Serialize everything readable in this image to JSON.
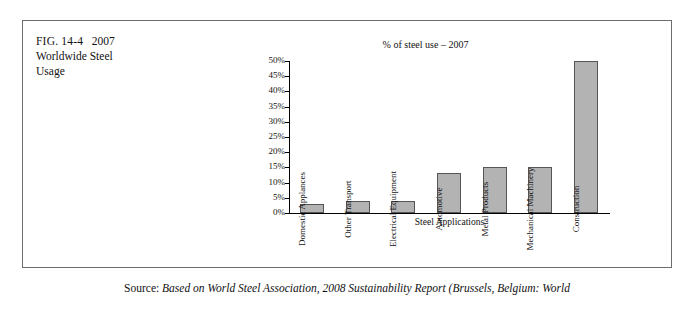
{
  "figure": {
    "label": "FIG. 14-4",
    "year": "2007",
    "title_line1": "Worldwide Steel",
    "title_line2": "Usage"
  },
  "source": {
    "prefix": "Source:",
    "text": "Based on World Steel Association, 2008 Sustainability Report (Brussels, Belgium: World"
  },
  "chart_data": {
    "type": "bar",
    "title": "% of steel use – 2007",
    "xlabel": "Steel Applications",
    "ylabel": "",
    "categories": [
      "Domestic Applances",
      "Other Transport",
      "Electrical Equipment",
      "Automotive",
      "Metal Products",
      "Mechanical Machinery",
      "Construction"
    ],
    "values": [
      3,
      4,
      4,
      13,
      15,
      15,
      50
    ],
    "ylim": [
      0,
      50
    ],
    "ytick_labels": [
      "50%",
      "45%",
      "40%",
      "35%",
      "30%",
      "25%",
      "20%",
      "15%",
      "10%",
      "5%",
      "0%"
    ],
    "ytick_values": [
      50,
      45,
      40,
      35,
      30,
      25,
      20,
      15,
      10,
      5,
      0
    ],
    "grid": false,
    "legend": "none",
    "bar_color": "#b3b3b3",
    "bar_edge_color": "#555555"
  }
}
